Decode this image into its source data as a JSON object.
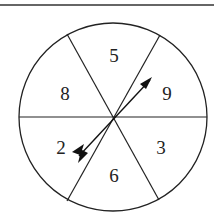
{
  "spinner": {
    "sections": [
      {
        "label": "5",
        "x": 114,
        "y": 62
      },
      {
        "label": "9",
        "x": 167,
        "y": 100
      },
      {
        "label": "3",
        "x": 161,
        "y": 154
      },
      {
        "label": "6",
        "x": 114,
        "y": 182
      },
      {
        "label": "2",
        "x": 61,
        "y": 154
      },
      {
        "label": "8",
        "x": 65,
        "y": 100
      }
    ],
    "colors": {
      "stroke": "#222222",
      "background": "#ffffff"
    }
  }
}
